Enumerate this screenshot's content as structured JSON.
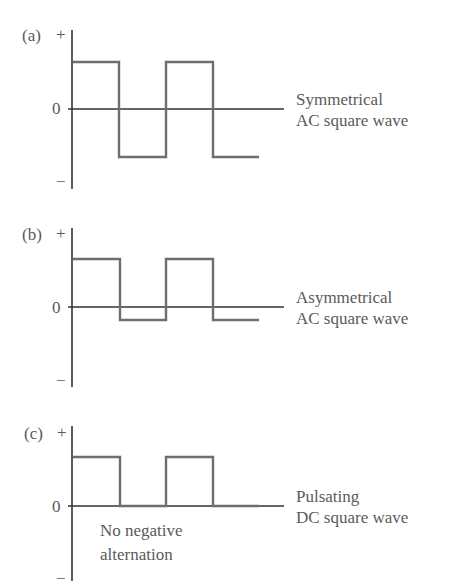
{
  "panels": [
    {
      "id": "a",
      "panel_label": "(a)",
      "plus_label": "+",
      "zero_label": "0",
      "minus_label": "−",
      "description_line1": "Symmetrical",
      "description_line2": "AC square wave",
      "waveform": "symmetrical AC"
    },
    {
      "id": "b",
      "panel_label": "(b)",
      "plus_label": "+",
      "zero_label": "0",
      "minus_label": "−",
      "description_line1": "Asymmetrical",
      "description_line2": "AC square wave",
      "waveform": "asymmetrical AC"
    },
    {
      "id": "c",
      "panel_label": "(c)",
      "plus_label": "+",
      "zero_label": "0",
      "minus_label": "−",
      "description_line1": "Pulsating",
      "description_line2": "DC square wave",
      "annotation_line1": "No negative",
      "annotation_line2": "alternation",
      "waveform": "pulsating DC"
    }
  ],
  "colors": {
    "waveform": "#6e6e6e",
    "axis": "#333333",
    "text": "#5a5a5a"
  }
}
